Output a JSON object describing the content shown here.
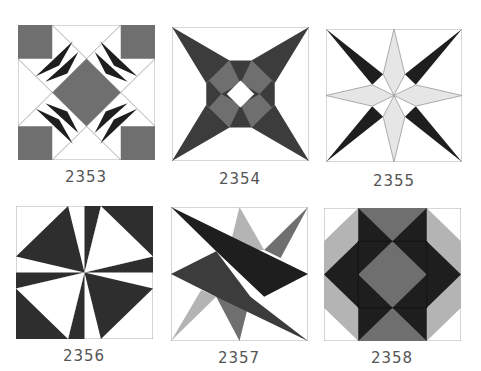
{
  "colors": {
    "black": "#1e1e1e",
    "dark": "#3c3c3c",
    "mid": "#6f6f6f",
    "light": "#b4b4b4",
    "pale": "#e6e6e6",
    "white": "#ffffff",
    "outline": "#9a9a9a",
    "label": "#555555"
  },
  "blocks": [
    {
      "id": "2353",
      "label": "2353"
    },
    {
      "id": "2354",
      "label": "2354"
    },
    {
      "id": "2355",
      "label": "2355"
    },
    {
      "id": "2356",
      "label": "2356"
    },
    {
      "id": "2357",
      "label": "2357"
    },
    {
      "id": "2358",
      "label": "2358"
    }
  ]
}
